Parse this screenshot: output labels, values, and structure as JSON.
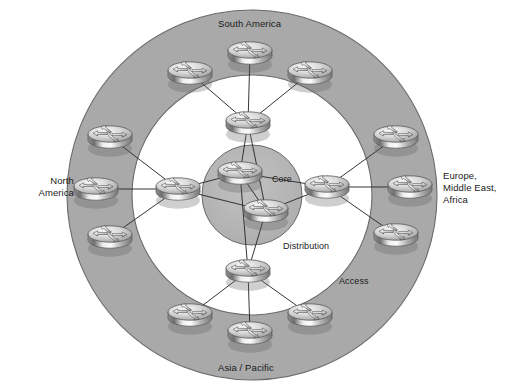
{
  "diagram": {
    "type": "network-topology",
    "canvas": {
      "width": 520,
      "height": 388
    },
    "colors": {
      "background": "#ffffff",
      "access_ring_fill": "#a9a9a9",
      "distribution_fill": "#ffffff",
      "core_fill": "#b6b6b6",
      "outline": "#5a5a5a",
      "link": "#2b2b2b",
      "text": "#1a1a1a",
      "router_body_light": "#f2f2f2",
      "router_body_mid": "#b0b0b0",
      "router_body_dark": "#6e6e6e"
    },
    "geometry": {
      "center": {
        "x": 252,
        "y": 195
      },
      "access_ring_outer_radius": 185,
      "access_ring_inner_radius": 120,
      "core_circle_radius": 50
    }
  },
  "region_labels": [
    {
      "id": "south-america",
      "text": "South America",
      "position": "top"
    },
    {
      "id": "north-america",
      "text": "North\nAmerica",
      "position": "left"
    },
    {
      "id": "emea",
      "text": "Europe,\nMiddle East,\nAfrica",
      "position": "right"
    },
    {
      "id": "asia-pacific",
      "text": "Asia / Pacific",
      "position": "bottom"
    }
  ],
  "tier_labels": [
    {
      "id": "core",
      "text": "Core"
    },
    {
      "id": "distribution",
      "text": "Distribution"
    },
    {
      "id": "access",
      "text": "Access"
    }
  ],
  "tiers": [
    {
      "name": "Core",
      "router_count": 2,
      "routers": [
        {
          "id": "core-1",
          "x": 240,
          "y": 176,
          "icon": "router-icon"
        },
        {
          "id": "core-2",
          "x": 266,
          "y": 214,
          "icon": "router-icon"
        }
      ]
    },
    {
      "name": "Distribution",
      "router_count": 4,
      "routers": [
        {
          "id": "dist-north",
          "x": 248,
          "y": 126,
          "region": "south-america",
          "icon": "router-icon"
        },
        {
          "id": "dist-west",
          "x": 178,
          "y": 192,
          "region": "north-america",
          "icon": "router-icon"
        },
        {
          "id": "dist-east",
          "x": 327,
          "y": 190,
          "region": "emea",
          "icon": "router-icon"
        },
        {
          "id": "dist-south",
          "x": 248,
          "y": 274,
          "region": "asia-pacific",
          "icon": "router-icon"
        }
      ]
    },
    {
      "name": "Access",
      "router_count": 12,
      "routers": [
        {
          "id": "acc-sa-1",
          "x": 190,
          "y": 76,
          "region": "south-america",
          "icon": "router-icon"
        },
        {
          "id": "acc-sa-2",
          "x": 250,
          "y": 56,
          "region": "south-america",
          "icon": "router-icon"
        },
        {
          "id": "acc-sa-3",
          "x": 310,
          "y": 76,
          "region": "south-america",
          "icon": "router-icon"
        },
        {
          "id": "acc-na-1",
          "x": 110,
          "y": 140,
          "region": "north-america",
          "icon": "router-icon"
        },
        {
          "id": "acc-na-2",
          "x": 96,
          "y": 192,
          "region": "north-america",
          "icon": "router-icon"
        },
        {
          "id": "acc-na-3",
          "x": 110,
          "y": 240,
          "region": "north-america",
          "icon": "router-icon"
        },
        {
          "id": "acc-em-1",
          "x": 396,
          "y": 140,
          "region": "emea",
          "icon": "router-icon"
        },
        {
          "id": "acc-em-2",
          "x": 410,
          "y": 190,
          "region": "emea",
          "icon": "router-icon"
        },
        {
          "id": "acc-em-3",
          "x": 396,
          "y": 238,
          "region": "emea",
          "icon": "router-icon"
        },
        {
          "id": "acc-ap-1",
          "x": 190,
          "y": 318,
          "region": "asia-pacific",
          "icon": "router-icon"
        },
        {
          "id": "acc-ap-2",
          "x": 250,
          "y": 336,
          "region": "asia-pacific",
          "icon": "router-icon"
        },
        {
          "id": "acc-ap-3",
          "x": 310,
          "y": 318,
          "region": "asia-pacific",
          "icon": "router-icon"
        }
      ]
    }
  ],
  "links": [
    {
      "from": "acc-sa-1",
      "to": "dist-north"
    },
    {
      "from": "acc-sa-2",
      "to": "dist-north"
    },
    {
      "from": "acc-sa-3",
      "to": "dist-north"
    },
    {
      "from": "acc-na-1",
      "to": "dist-west"
    },
    {
      "from": "acc-na-2",
      "to": "dist-west"
    },
    {
      "from": "acc-na-3",
      "to": "dist-west"
    },
    {
      "from": "acc-em-1",
      "to": "dist-east"
    },
    {
      "from": "acc-em-2",
      "to": "dist-east"
    },
    {
      "from": "acc-em-3",
      "to": "dist-east"
    },
    {
      "from": "acc-ap-1",
      "to": "dist-south"
    },
    {
      "from": "acc-ap-2",
      "to": "dist-south"
    },
    {
      "from": "acc-ap-3",
      "to": "dist-south"
    },
    {
      "from": "dist-north",
      "to": "core-1"
    },
    {
      "from": "dist-north",
      "to": "core-2"
    },
    {
      "from": "dist-west",
      "to": "core-1"
    },
    {
      "from": "dist-west",
      "to": "core-2"
    },
    {
      "from": "dist-east",
      "to": "core-1"
    },
    {
      "from": "dist-east",
      "to": "core-2"
    },
    {
      "from": "dist-south",
      "to": "core-1"
    },
    {
      "from": "dist-south",
      "to": "core-2"
    },
    {
      "from": "core-1",
      "to": "core-2"
    }
  ]
}
